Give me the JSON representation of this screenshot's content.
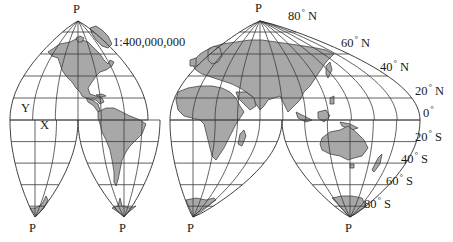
{
  "map": {
    "title": "Interrupted world map projection",
    "scale_label": "1:400,000,000",
    "colors": {
      "land": "#a8a8a8",
      "line": "#333333",
      "background": "#ffffff"
    },
    "pole_label": "P",
    "point_labels": [
      {
        "id": "Y",
        "text": "Y"
      },
      {
        "id": "X",
        "text": "X"
      }
    ],
    "latitude_labels": [
      {
        "deg": "80",
        "hemi": "N"
      },
      {
        "deg": "60",
        "hemi": "N"
      },
      {
        "deg": "40",
        "hemi": "N"
      },
      {
        "deg": "20",
        "hemi": "N"
      },
      {
        "deg": "0",
        "hemi": ""
      },
      {
        "deg": "20",
        "hemi": "S"
      },
      {
        "deg": "40",
        "hemi": "S"
      },
      {
        "deg": "60",
        "hemi": "S"
      },
      {
        "deg": "80",
        "hemi": "S"
      }
    ],
    "degree_symbol": "°",
    "poles": {
      "north": [
        "P",
        "P"
      ],
      "south": [
        "P",
        "P",
        "P",
        "P"
      ]
    }
  }
}
